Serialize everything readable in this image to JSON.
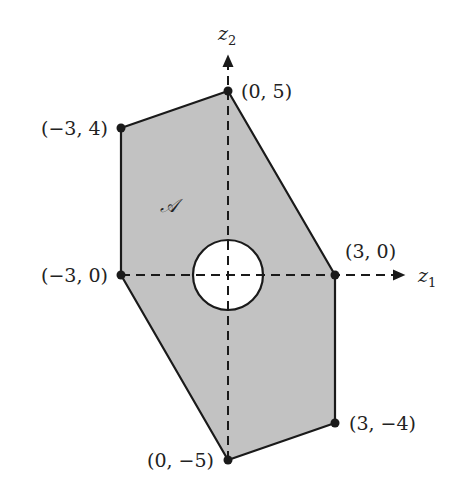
{
  "diagram": {
    "region_label": "𝒜",
    "fill_color": "#c2c2c2",
    "edge_color": "#1a1a1a",
    "axes": {
      "x_label": "z",
      "x_sub": "1",
      "y_label": "z",
      "y_sub": "2"
    },
    "vertices": [
      {
        "label": "(0, 5)"
      },
      {
        "label": "(−3, 4)"
      },
      {
        "label": "(−3, 0)"
      },
      {
        "label": "(0, −5)"
      },
      {
        "label": "(3, −4)"
      },
      {
        "label": "(3, 0)"
      }
    ],
    "hole": {
      "center": "(0, 0)",
      "radius_units": 1
    }
  }
}
